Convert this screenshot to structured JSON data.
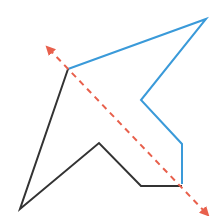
{
  "diagram": {
    "width": 214,
    "height": 216,
    "colors": {
      "blue_path": "#3a9ad9",
      "black_path": "#333333",
      "axis": "#e8604c"
    },
    "blue_path_points": [
      [
        68,
        69
      ],
      [
        206,
        19
      ],
      [
        141,
        100
      ],
      [
        182,
        144
      ],
      [
        182,
        184
      ]
    ],
    "black_path_points": [
      [
        68,
        69
      ],
      [
        20,
        209
      ],
      [
        99,
        143
      ],
      [
        141,
        186
      ],
      [
        182,
        186
      ]
    ],
    "symmetry_axis": {
      "x1": 49,
      "y1": 49,
      "x2": 206,
      "y2": 213,
      "style": "dashed",
      "arrows": "both"
    }
  }
}
